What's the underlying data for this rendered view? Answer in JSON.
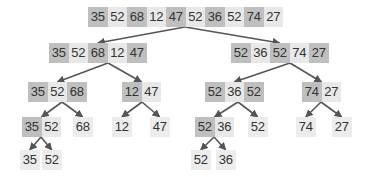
{
  "colors": {
    "dark_cell": "#bfbfbf",
    "light_cell": "#e8e8e8",
    "text": "#333333",
    "edge": "#555555"
  },
  "nodes": [
    {
      "id": "n0",
      "level": 0,
      "values": [
        "35",
        "52",
        "68",
        "12",
        "47",
        "52",
        "36",
        "52",
        "74",
        "27"
      ],
      "shade": [
        "d",
        "l",
        "d",
        "l",
        "d",
        "l",
        "d",
        "l",
        "d",
        "l"
      ]
    },
    {
      "id": "n1",
      "level": 1,
      "values": [
        "35",
        "52",
        "68",
        "12",
        "47"
      ],
      "shade": [
        "d",
        "l",
        "d",
        "l",
        "d"
      ]
    },
    {
      "id": "n2",
      "level": 1,
      "values": [
        "52",
        "36",
        "52",
        "74",
        "27"
      ],
      "shade": [
        "d",
        "l",
        "d",
        "l",
        "d"
      ]
    },
    {
      "id": "n3",
      "level": 2,
      "values": [
        "35",
        "52",
        "68"
      ],
      "shade": [
        "d",
        "l",
        "d"
      ]
    },
    {
      "id": "n4",
      "level": 2,
      "values": [
        "12",
        "47"
      ],
      "shade": [
        "d",
        "l"
      ]
    },
    {
      "id": "n5",
      "level": 2,
      "values": [
        "52",
        "36",
        "52"
      ],
      "shade": [
        "d",
        "l",
        "d"
      ]
    },
    {
      "id": "n6",
      "level": 2,
      "values": [
        "74",
        "27"
      ],
      "shade": [
        "d",
        "l"
      ]
    },
    {
      "id": "n7",
      "level": 3,
      "values": [
        "35",
        "52"
      ],
      "shade": [
        "d",
        "l"
      ]
    },
    {
      "id": "n8",
      "level": 3,
      "values": [
        "68"
      ],
      "shade": [
        "s"
      ]
    },
    {
      "id": "n9",
      "level": 3,
      "values": [
        "12"
      ],
      "shade": [
        "s"
      ]
    },
    {
      "id": "n10",
      "level": 3,
      "values": [
        "47"
      ],
      "shade": [
        "s"
      ]
    },
    {
      "id": "n11",
      "level": 3,
      "values": [
        "52",
        "36"
      ],
      "shade": [
        "d",
        "l"
      ]
    },
    {
      "id": "n12",
      "level": 3,
      "values": [
        "52"
      ],
      "shade": [
        "s"
      ]
    },
    {
      "id": "n13",
      "level": 3,
      "values": [
        "74"
      ],
      "shade": [
        "s"
      ]
    },
    {
      "id": "n14",
      "level": 3,
      "values": [
        "27"
      ],
      "shade": [
        "s"
      ]
    },
    {
      "id": "n15",
      "level": 4,
      "values": [
        "35"
      ],
      "shade": [
        "s"
      ]
    },
    {
      "id": "n16",
      "level": 4,
      "values": [
        "52"
      ],
      "shade": [
        "s"
      ]
    },
    {
      "id": "n17",
      "level": 4,
      "values": [
        "52"
      ],
      "shade": [
        "s"
      ]
    },
    {
      "id": "n18",
      "level": 4,
      "values": [
        "36"
      ],
      "shade": [
        "s"
      ]
    }
  ],
  "edges": [
    [
      "n0",
      "n1"
    ],
    [
      "n0",
      "n2"
    ],
    [
      "n1",
      "n3"
    ],
    [
      "n1",
      "n4"
    ],
    [
      "n2",
      "n5"
    ],
    [
      "n2",
      "n6"
    ],
    [
      "n3",
      "n7"
    ],
    [
      "n3",
      "n8"
    ],
    [
      "n4",
      "n9"
    ],
    [
      "n4",
      "n10"
    ],
    [
      "n5",
      "n11"
    ],
    [
      "n5",
      "n12"
    ],
    [
      "n6",
      "n13"
    ],
    [
      "n6",
      "n14"
    ],
    [
      "n7",
      "n15"
    ],
    [
      "n7",
      "n16"
    ],
    [
      "n11",
      "n17"
    ],
    [
      "n11",
      "n18"
    ]
  ]
}
